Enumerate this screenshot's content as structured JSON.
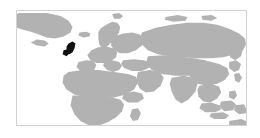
{
  "widget": {
    "name": "world-map-locator",
    "caption": "",
    "background_color": "#ffffff"
  },
  "map": {
    "title": "",
    "projection": "equirectangular",
    "center_hemisphere": "Eastern Hemisphere",
    "frame": {
      "border_color": "#d2d2d2",
      "border_width_px": 1,
      "left_px": 16,
      "top_px": 10,
      "width_px": 231,
      "height_px": 116
    },
    "colors": {
      "land": "#b2b2b2",
      "ocean": "#ffffff",
      "highlight": "#111111",
      "page_background": "#ffffff"
    },
    "legend": {
      "visible": false,
      "entries": []
    },
    "graticule": {
      "visible": false
    },
    "labels": {
      "visible": false,
      "items": []
    },
    "highlighted_regions": [
      {
        "name": "United Kingdom",
        "color": "#111111",
        "center_x_px": 70,
        "center_y_px": 47
      }
    ],
    "landmasses": [
      {
        "name": "Greenland"
      },
      {
        "name": "Iceland"
      },
      {
        "name": "Scandinavia"
      },
      {
        "name": "Europe"
      },
      {
        "name": "Africa"
      },
      {
        "name": "Arabian Peninsula"
      },
      {
        "name": "Russia / Siberia"
      },
      {
        "name": "Central Asia"
      },
      {
        "name": "India"
      },
      {
        "name": "China"
      },
      {
        "name": "Japan"
      },
      {
        "name": "Southeast Asia"
      },
      {
        "name": "Indonesia"
      },
      {
        "name": "Philippines"
      },
      {
        "name": "New Guinea"
      },
      {
        "name": "Australia (northern edge)"
      }
    ]
  }
}
